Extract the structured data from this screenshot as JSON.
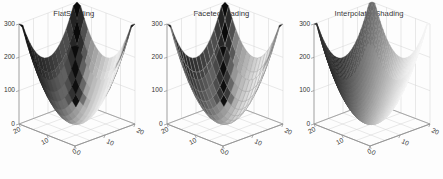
{
  "figure": {
    "background_color": "#fdfdfd",
    "panel_count": 3
  },
  "panels": [
    {
      "title": "FlatShading",
      "shading": "flat",
      "axis": {
        "z_ticks": [
          "300",
          "200",
          "100",
          "0"
        ],
        "x_ticks": [
          "0",
          "10",
          "20"
        ],
        "y_ticks": [
          "0",
          "10",
          "20"
        ],
        "z_label": "",
        "x_label": "",
        "y_label": ""
      }
    },
    {
      "title": "FacetedShading",
      "shading": "faceted",
      "axis": {
        "z_ticks": [
          "300",
          "200",
          "100",
          "0"
        ],
        "x_ticks": [
          "0",
          "10",
          "20"
        ],
        "y_ticks": [
          "0",
          "10",
          "20"
        ],
        "z_label": "",
        "x_label": "",
        "y_label": ""
      }
    },
    {
      "title": "InterpolatedShading",
      "shading": "interpolated",
      "axis": {
        "z_ticks": [
          "300",
          "200",
          "100",
          "0"
        ],
        "x_ticks": [
          "0",
          "10",
          "20"
        ],
        "y_ticks": [
          "0",
          "10",
          "20"
        ],
        "z_label": "",
        "x_label": "",
        "y_label": ""
      }
    }
  ],
  "chart_data": {
    "type": "surface",
    "title": "",
    "subtitle": "",
    "surface_function": "z = x^2 + y^2 (paraboloid bowl)",
    "colormap": "gray",
    "xlabel": "",
    "ylabel": "",
    "zlabel": "",
    "xlim": [
      0,
      20
    ],
    "ylim": [
      0,
      20
    ],
    "zlim": [
      0,
      300
    ],
    "xticks": [
      0,
      10,
      20
    ],
    "yticks": [
      0,
      10,
      20
    ],
    "zticks": [
      0,
      100,
      200,
      300
    ],
    "grid": true,
    "legend": "none",
    "mesh_n": 16,
    "view": "3d azimuth -37.5, elevation 30",
    "variants": [
      {
        "name": "FlatShading",
        "shading": "flat",
        "edges": false
      },
      {
        "name": "FacetedShading",
        "shading": "flat",
        "edges": true
      },
      {
        "name": "InterpolatedShading",
        "shading": "interp",
        "edges": false
      }
    ]
  }
}
